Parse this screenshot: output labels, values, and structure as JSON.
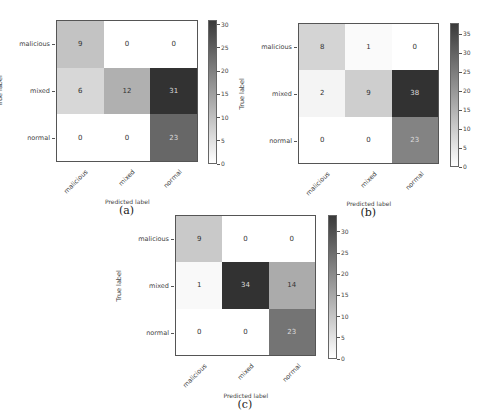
{
  "chart_data": [
    {
      "type": "heatmap",
      "caption": "(a)",
      "xlabel": "Predicted label",
      "ylabel": "True label",
      "x_categories": [
        "malicious",
        "mixed",
        "normal"
      ],
      "y_categories": [
        "malicious",
        "mixed",
        "normal"
      ],
      "values": [
        [
          9,
          0,
          0
        ],
        [
          6,
          12,
          31
        ],
        [
          0,
          0,
          23
        ]
      ],
      "colorbar": {
        "min": 0,
        "max": 31,
        "ticks": [
          0,
          5,
          10,
          15,
          20,
          25,
          30
        ]
      },
      "colormap": "Greys"
    },
    {
      "type": "heatmap",
      "caption": "(b)",
      "xlabel": "Predicted label",
      "ylabel": "True label",
      "x_categories": [
        "malicious",
        "mixed",
        "normal"
      ],
      "y_categories": [
        "malicious",
        "mixed",
        "normal"
      ],
      "values": [
        [
          8,
          1,
          0
        ],
        [
          2,
          9,
          38
        ],
        [
          0,
          0,
          23
        ]
      ],
      "colorbar": {
        "min": 0,
        "max": 38,
        "ticks": [
          0,
          5,
          10,
          15,
          20,
          25,
          30,
          35
        ]
      },
      "colormap": "Greys"
    },
    {
      "type": "heatmap",
      "caption": "(c)",
      "xlabel": "Predicted label",
      "ylabel": "True label",
      "x_categories": [
        "malicious",
        "mixed",
        "normal"
      ],
      "y_categories": [
        "malicious",
        "mixed",
        "normal"
      ],
      "values": [
        [
          9,
          0,
          0
        ],
        [
          1,
          34,
          14
        ],
        [
          0,
          0,
          23
        ]
      ],
      "colorbar": {
        "min": 0,
        "max": 34,
        "ticks": [
          0,
          5,
          10,
          15,
          20,
          25,
          30
        ]
      },
      "colormap": "Greys"
    }
  ],
  "layout": [
    {
      "left": 56,
      "top": 20,
      "size": 142,
      "cbar_left": 208,
      "cbar_top": 20,
      "cbar_h": 144
    },
    {
      "left": 298,
      "top": 23,
      "size": 141,
      "cbar_left": 450,
      "cbar_top": 23,
      "cbar_h": 144
    },
    {
      "left": 175,
      "top": 215,
      "size": 141,
      "cbar_left": 328,
      "cbar_top": 215,
      "cbar_h": 144
    }
  ]
}
